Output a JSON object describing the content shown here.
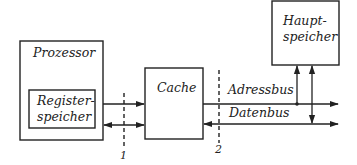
{
  "diagram": {
    "nodes": {
      "processor": {
        "label": "Prozessor"
      },
      "register": {
        "label_line1": "Register-",
        "label_line2": "speicher"
      },
      "cache": {
        "label": "Cache"
      },
      "main_memory": {
        "label_line1": "Haupt-",
        "label_line2": "speicher"
      }
    },
    "buses": {
      "address": {
        "label": "Adressbus"
      },
      "data": {
        "label": "Datenbus"
      }
    },
    "boundaries": [
      {
        "label": "1"
      },
      {
        "label": "2"
      }
    ],
    "colors": {
      "stroke": "#222222",
      "background": "#ffffff"
    }
  }
}
